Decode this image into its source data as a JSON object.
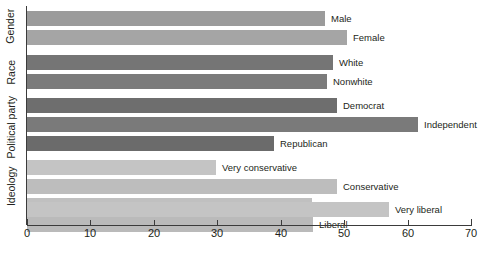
{
  "chart_data": {
    "type": "bar",
    "orientation": "horizontal",
    "title": "",
    "xlabel": "",
    "ylabel": "",
    "xlim": [
      0,
      70
    ],
    "xticks": [
      0,
      10,
      20,
      30,
      40,
      50,
      60,
      70
    ],
    "xtick_labels": [
      "0",
      "10",
      "20",
      "30",
      "40",
      "50",
      "60",
      "70"
    ],
    "grid": false,
    "legend": "none",
    "data_labels": "at bar end",
    "groups": [
      {
        "name": "Gender",
        "color": "#9b9b9b",
        "categories": [
          "Male",
          "Female"
        ],
        "values": [
          47,
          50.5
        ]
      },
      {
        "name": "Race",
        "color": "#777777",
        "categories": [
          "White",
          "Nonwhite"
        ],
        "values": [
          48.3,
          47.3
        ]
      },
      {
        "name": "Political party",
        "color": "#777777",
        "categories": [
          "Democrat",
          "Independent",
          "Republican"
        ],
        "values": [
          48.9,
          61.7,
          39
        ]
      },
      {
        "name": "Ideology",
        "color": "#bdbdbd",
        "categories": [
          "Very conservative",
          "Conservative",
          "Moderate",
          "Liberal",
          "Very liberal"
        ],
        "values": [
          29.8,
          48.9,
          45,
          45.1,
          57
        ]
      }
    ],
    "bars": [
      {
        "group": "Gender",
        "label": "Male",
        "value": 47,
        "color": "#9b9b9b"
      },
      {
        "group": "Gender",
        "label": "Female",
        "value": 50.5,
        "color": "#a5a5a5"
      },
      {
        "group": "Race",
        "label": "White",
        "value": 48.3,
        "color": "#757575"
      },
      {
        "group": "Race",
        "label": "Nonwhite",
        "value": 47.3,
        "color": "#7b7b7b"
      },
      {
        "group": "Political party",
        "label": "Democrat",
        "value": 48.9,
        "color": "#6e6e6e"
      },
      {
        "group": "Political party",
        "label": "Independent",
        "value": 61.7,
        "color": "#7a7a7a"
      },
      {
        "group": "Political party",
        "label": "Republican",
        "value": 39,
        "color": "#6b6b6b"
      },
      {
        "group": "Ideology",
        "label": "Very conservative",
        "value": 29.8,
        "color": "#c4c4c4"
      },
      {
        "group": "Ideology",
        "label": "Conservative",
        "value": 48.9,
        "color": "#bdbdbd"
      },
      {
        "group": "Ideology",
        "label": "Moderate",
        "value": 45,
        "color": "#c0c0c0"
      },
      {
        "group": "Ideology",
        "label": "Liberal",
        "value": 45.1,
        "color": "#bababa"
      },
      {
        "group": "Ideology",
        "label": "Very liberal",
        "value": 57,
        "color": "#c4c4c4"
      }
    ]
  },
  "axis": {
    "group_labels": [
      "Gender",
      "Race",
      "Political party",
      "Ideology"
    ],
    "tick_labels": [
      "0",
      "10",
      "20",
      "30",
      "40",
      "50",
      "60",
      "70"
    ]
  },
  "bar_labels": {
    "male": "Male",
    "female": "Female",
    "white": "White",
    "nonwhite": "Nonwhite",
    "democrat": "Democrat",
    "independent": "Independent",
    "republican": "Republican",
    "very_conservative": "Very conservative",
    "conservative": "Conservative",
    "moderate": "Moderate",
    "liberal": "Liberal",
    "very_liberal": "Very liberal"
  }
}
